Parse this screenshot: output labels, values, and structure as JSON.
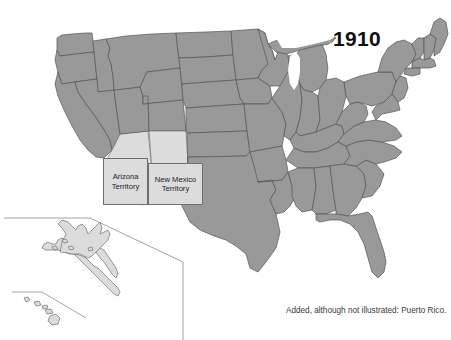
{
  "figure": {
    "kind": "historical-map",
    "year": "1910",
    "footnote": "Added, although not illustrated: Puerto Rico.",
    "background_color": "#ffffff"
  },
  "palette": {
    "state_fill": "#999999",
    "state_border": "#555555",
    "territory_fill": "#dcdcdc",
    "territory_border": "#6f6f6f",
    "inset_border": "#8a8a8a",
    "water": "#ffffff",
    "text": "#111111",
    "footnote_text": "#3a3a3a"
  },
  "territories": [
    {
      "id": "arizona",
      "line1": "Arizona",
      "line2": "Territory"
    },
    {
      "id": "new-mexico",
      "line1": "New Mexico",
      "line2": "Territory"
    }
  ],
  "inset": {
    "name": "alaska-hawaii-inset",
    "regions": [
      "Alaska",
      "Hawaii"
    ]
  }
}
